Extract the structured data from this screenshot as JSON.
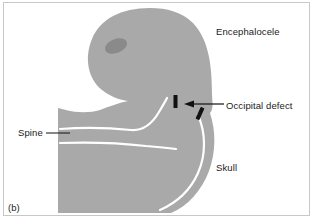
{
  "figure": {
    "caption": "(b)",
    "type": "medical-illustration",
    "colors": {
      "tissue_fill": "#a9a9a9",
      "lesion_fill": "#8a8a8a",
      "internal_line": "#ffffff",
      "marker": "#111111",
      "frame": "#c8c8c8",
      "background": "#ffffff",
      "text": "#1b1b1b"
    }
  },
  "labels": {
    "encephalocele": "Encephalocele",
    "occipital_defect": "Occipital defect",
    "spine": "Spine",
    "skull": "Skull"
  },
  "annotations": {
    "arrow_target": "occipital defect gap",
    "marker_count": 2
  }
}
